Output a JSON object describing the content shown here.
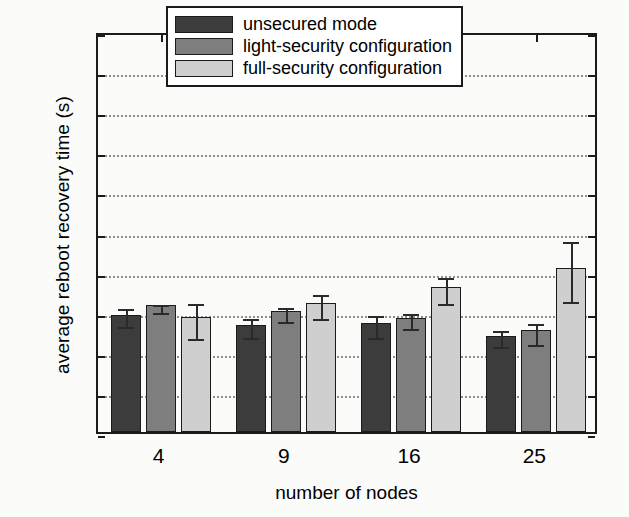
{
  "chart_data": {
    "type": "bar",
    "title": "",
    "xlabel": "number of nodes",
    "ylabel": "average reboot recovery time (s)",
    "categories": [
      "4",
      "9",
      "16",
      "25"
    ],
    "ylim": [
      0,
      10
    ],
    "yticks": [
      "0",
      "1",
      "2",
      "3",
      "4",
      "5",
      "6",
      "7",
      "8",
      "9",
      "10"
    ],
    "grid": true,
    "legend_position": "top-center",
    "series": [
      {
        "name": "unsecured mode",
        "color": "#3c3c3c",
        "values": [
          2.93,
          2.68,
          2.73,
          2.4
        ],
        "errors_low": [
          2.72,
          2.45,
          2.45,
          2.22
        ],
        "errors_high": [
          3.16,
          2.92,
          3.0,
          2.63
        ]
      },
      {
        "name": "light-security configuration",
        "color": "#7e7e7e",
        "values": [
          3.17,
          3.02,
          2.85,
          2.55
        ],
        "errors_low": [
          3.06,
          2.85,
          2.68,
          2.26
        ],
        "errors_high": [
          3.27,
          3.2,
          3.03,
          2.79
        ]
      },
      {
        "name": "full-security configuration",
        "color": "#cfcfcf",
        "values": [
          2.87,
          3.22,
          3.61,
          4.1
        ],
        "errors_low": [
          2.43,
          2.93,
          3.29,
          3.35
        ],
        "errors_high": [
          3.3,
          3.52,
          3.94,
          4.85
        ]
      }
    ]
  },
  "legend": {
    "items": [
      {
        "label": "unsecured mode"
      },
      {
        "label": "light-security configuration"
      },
      {
        "label": "full-security configuration"
      }
    ]
  }
}
